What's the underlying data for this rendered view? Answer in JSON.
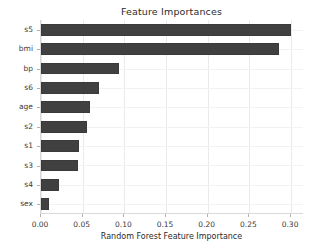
{
  "chart_data": {
    "type": "bar",
    "orientation": "horizontal",
    "title": "Feature Importances",
    "xlabel": "Random Forest Feature Importance",
    "ylabel": "",
    "categories": [
      "s5",
      "bmi",
      "bp",
      "s6",
      "age",
      "s2",
      "s1",
      "s3",
      "s4",
      "sex"
    ],
    "values": [
      0.3,
      0.285,
      0.094,
      0.07,
      0.059,
      0.055,
      0.046,
      0.044,
      0.021,
      0.009
    ],
    "xlim": [
      0.0,
      0.3155
    ],
    "xticks": [
      0.0,
      0.05,
      0.1,
      0.15,
      0.2,
      0.25,
      0.3
    ],
    "xtick_labels": [
      "0.00",
      "0.05",
      "0.10",
      "0.15",
      "0.20",
      "0.25",
      "0.30"
    ],
    "grid": true,
    "legend": null,
    "bar_color": "#404040",
    "grid_color": "#eaeaea",
    "background_color": "#ffffff",
    "text_color": "#2b2b2b"
  }
}
